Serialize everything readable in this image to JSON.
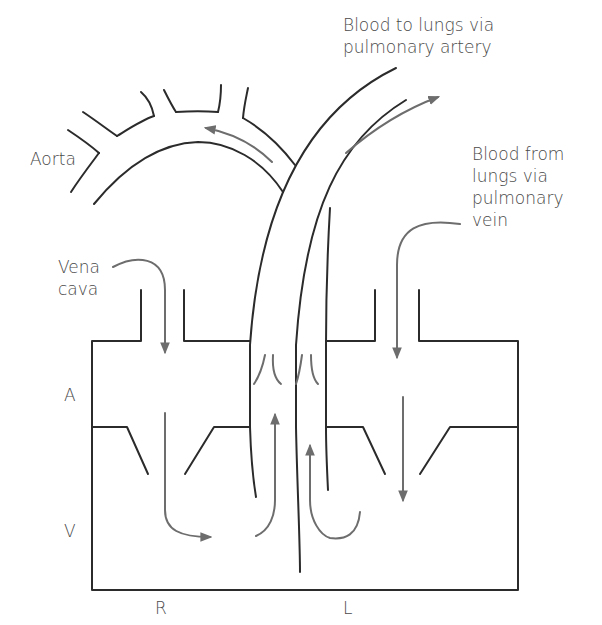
{
  "diagram": {
    "labels": {
      "pulmonary_artery": [
        "Blood to lungs via",
        "pulmonary artery"
      ],
      "pulmonary_vein": [
        "Blood from",
        "lungs via",
        "pulmonary",
        "vein"
      ],
      "aorta": "Aorta",
      "vena_cava": [
        "Vena",
        "cava"
      ],
      "atrium": "A",
      "ventricle": "V",
      "right_side": "R",
      "left_side": "L"
    },
    "colors": {
      "outline": "#2b2b2b",
      "flow_arrow": "#6d6d6d",
      "text": "#4a4a4a"
    },
    "caption_partial": "Figure 13.10 Simplified diagram of the heart and..."
  }
}
